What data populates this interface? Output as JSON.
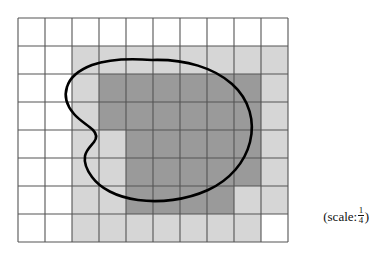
{
  "figure": {
    "type": "geometry-diagram",
    "grid": {
      "columns": 10,
      "rows": 8,
      "x_start": 18,
      "y_start": 18,
      "cell_width": 27,
      "cell_height": 28,
      "line_color": "#555555",
      "line_width": 1.1
    },
    "shading": {
      "outer_color": "#d6d6d6",
      "outer_label": "outer approximation cells",
      "inner_color": "#9a9a9a",
      "inner_label": "inner approximation cells"
    },
    "curve": {
      "stroke_color": "#000000",
      "stroke_width": 2.6,
      "fill": "none",
      "closed": true
    },
    "outer_cells": [
      [
        2,
        1
      ],
      [
        3,
        1
      ],
      [
        4,
        1
      ],
      [
        5,
        1
      ],
      [
        6,
        1
      ],
      [
        7,
        1
      ],
      [
        8,
        1
      ],
      [
        9,
        1
      ],
      [
        2,
        2
      ],
      [
        3,
        2
      ],
      [
        4,
        2
      ],
      [
        5,
        2
      ],
      [
        6,
        2
      ],
      [
        7,
        2
      ],
      [
        8,
        2
      ],
      [
        9,
        2
      ],
      [
        2,
        3
      ],
      [
        3,
        3
      ],
      [
        4,
        3
      ],
      [
        5,
        3
      ],
      [
        6,
        3
      ],
      [
        7,
        3
      ],
      [
        8,
        3
      ],
      [
        9,
        3
      ],
      [
        2,
        4
      ],
      [
        3,
        4
      ],
      [
        4,
        4
      ],
      [
        5,
        4
      ],
      [
        6,
        4
      ],
      [
        7,
        4
      ],
      [
        8,
        4
      ],
      [
        9,
        4
      ],
      [
        2,
        5
      ],
      [
        3,
        5
      ],
      [
        4,
        5
      ],
      [
        5,
        5
      ],
      [
        6,
        5
      ],
      [
        7,
        5
      ],
      [
        8,
        5
      ],
      [
        9,
        5
      ],
      [
        2,
        6
      ],
      [
        3,
        6
      ],
      [
        4,
        6
      ],
      [
        5,
        6
      ],
      [
        6,
        6
      ],
      [
        7,
        6
      ],
      [
        8,
        6
      ],
      [
        9,
        6
      ],
      [
        2,
        7
      ],
      [
        3,
        7
      ],
      [
        4,
        7
      ],
      [
        5,
        7
      ],
      [
        6,
        7
      ],
      [
        7,
        7
      ],
      [
        8,
        7
      ]
    ],
    "inner_cells": [
      [
        3,
        2
      ],
      [
        4,
        2
      ],
      [
        5,
        2
      ],
      [
        6,
        2
      ],
      [
        7,
        2
      ],
      [
        8,
        2
      ],
      [
        3,
        3
      ],
      [
        4,
        3
      ],
      [
        5,
        3
      ],
      [
        6,
        3
      ],
      [
        7,
        3
      ],
      [
        8,
        3
      ],
      [
        4,
        4
      ],
      [
        5,
        4
      ],
      [
        6,
        4
      ],
      [
        7,
        4
      ],
      [
        8,
        4
      ],
      [
        4,
        5
      ],
      [
        5,
        5
      ],
      [
        6,
        5
      ],
      [
        7,
        5
      ],
      [
        8,
        5
      ],
      [
        4,
        6
      ],
      [
        5,
        6
      ],
      [
        6,
        6
      ],
      [
        7,
        6
      ]
    ],
    "scale": {
      "prefix": "(scale:",
      "numerator": "1",
      "denominator": "4",
      "suffix": ")",
      "full_text": "(scale: 1/4)"
    }
  }
}
